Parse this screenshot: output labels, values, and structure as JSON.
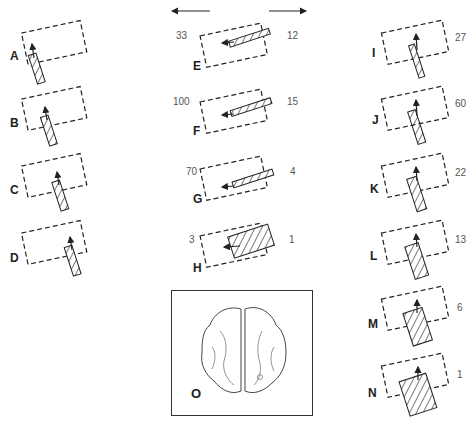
{
  "figure": {
    "direction_arrows": {
      "left": "left-arrow",
      "right": "right-arrow"
    },
    "panels": [
      {
        "id": "A",
        "label": "A",
        "left_value": null,
        "right_value": null,
        "column": "left"
      },
      {
        "id": "B",
        "label": "B",
        "left_value": null,
        "right_value": null,
        "column": "left"
      },
      {
        "id": "C",
        "label": "C",
        "left_value": null,
        "right_value": null,
        "column": "left"
      },
      {
        "id": "D",
        "label": "D",
        "left_value": null,
        "right_value": null,
        "column": "left"
      },
      {
        "id": "E",
        "label": "E",
        "left_value": "33",
        "right_value": "12",
        "column": "middle"
      },
      {
        "id": "F",
        "label": "F",
        "left_value": "100",
        "right_value": "15",
        "column": "middle"
      },
      {
        "id": "G",
        "label": "G",
        "left_value": "70",
        "right_value": "4",
        "column": "middle"
      },
      {
        "id": "H",
        "label": "H",
        "left_value": "3",
        "right_value": "1",
        "column": "middle"
      },
      {
        "id": "I",
        "label": "I",
        "right_value": "27",
        "column": "right"
      },
      {
        "id": "J",
        "label": "J",
        "right_value": "60",
        "column": "right"
      },
      {
        "id": "K",
        "label": "K",
        "right_value": "22",
        "column": "right"
      },
      {
        "id": "L",
        "label": "L",
        "right_value": "13",
        "column": "right"
      },
      {
        "id": "M",
        "label": "M",
        "right_value": "6",
        "column": "right"
      },
      {
        "id": "N",
        "label": "N",
        "right_value": "1",
        "column": "right"
      }
    ],
    "inset": {
      "label": "O",
      "content": "brain-dorsal-view-illustration"
    }
  }
}
